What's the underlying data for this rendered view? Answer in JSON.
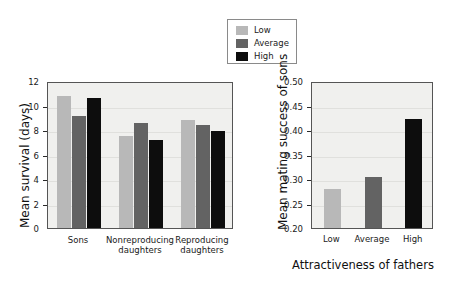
{
  "legend": {
    "items": [
      {
        "label": "Low",
        "color": "#b8b8b8"
      },
      {
        "label": "Average",
        "color": "#636363"
      },
      {
        "label": "High",
        "color": "#0d0d0d"
      }
    ]
  },
  "chart_data": [
    {
      "id": "left",
      "type": "bar",
      "title": "",
      "xlabel": "",
      "ylabel": "Mean survival (days)",
      "categories": [
        "Sons",
        "Nonreproducing\ndaughters",
        "Reproducing\ndaughters"
      ],
      "series": [
        {
          "name": "Low",
          "color": "#b8b8b8",
          "values": [
            10.8,
            7.55,
            8.85
          ]
        },
        {
          "name": "Average",
          "color": "#636363",
          "values": [
            9.15,
            8.6,
            8.45
          ]
        },
        {
          "name": "High",
          "color": "#0d0d0d",
          "values": [
            10.6,
            7.15,
            7.9
          ]
        }
      ],
      "ylim": [
        0,
        12
      ],
      "yticks": [
        0,
        2,
        4,
        6,
        8,
        10,
        12
      ],
      "ytick_labels": [
        "0",
        "2",
        "4",
        "6",
        "8",
        "10",
        "12"
      ],
      "grid": true,
      "legend_position": "top-center"
    },
    {
      "id": "right",
      "type": "bar",
      "title": "",
      "xlabel": "Attractiveness of fathers",
      "ylabel": "Mean mating success of sons",
      "categories": [
        "Low",
        "Average",
        "High"
      ],
      "values": [
        0.28,
        0.305,
        0.423
      ],
      "colors": [
        "#b8b8b8",
        "#636363",
        "#0d0d0d"
      ],
      "ylim": [
        0.2,
        0.5
      ],
      "yticks": [
        0.2,
        0.25,
        0.3,
        0.35,
        0.4,
        0.45,
        0.5
      ],
      "ytick_labels": [
        "0.20",
        "0.25",
        "0.30",
        "0.35",
        "0.40",
        "0.45",
        "0.50"
      ],
      "grid": true
    }
  ]
}
